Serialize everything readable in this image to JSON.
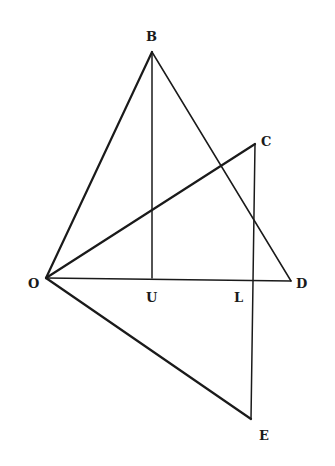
{
  "diagram": {
    "points": [
      {
        "id": "B",
        "label": "B"
      },
      {
        "id": "C",
        "label": "C"
      },
      {
        "id": "O",
        "label": "O"
      },
      {
        "id": "U",
        "label": "U"
      },
      {
        "id": "L",
        "label": "L"
      },
      {
        "id": "D",
        "label": "D"
      },
      {
        "id": "E",
        "label": "E"
      }
    ],
    "segments": [
      {
        "from": "O",
        "to": "B"
      },
      {
        "from": "B",
        "to": "U"
      },
      {
        "from": "B",
        "to": "D"
      },
      {
        "from": "O",
        "to": "C"
      },
      {
        "from": "C",
        "to": "E"
      },
      {
        "from": "O",
        "to": "D"
      },
      {
        "from": "O",
        "to": "E"
      }
    ],
    "colors": {
      "ink": "#1a1a1a",
      "background": "#ffffff"
    }
  }
}
